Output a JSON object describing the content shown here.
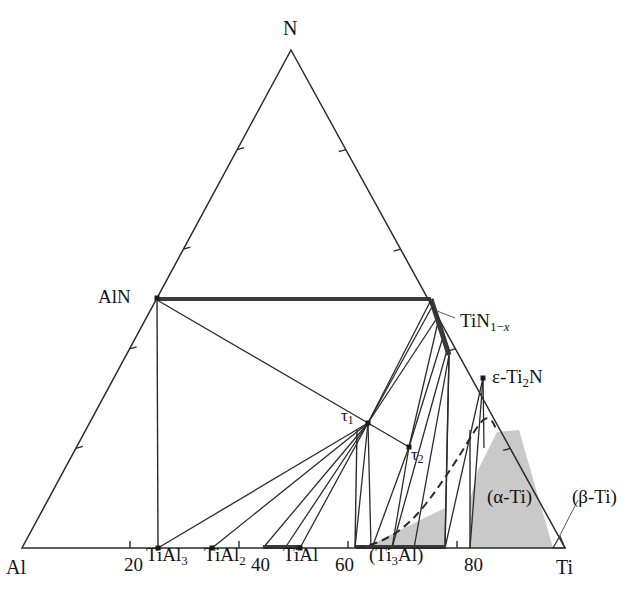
{
  "figure": {
    "kind": "ternary-phase-diagram",
    "system": "Al-Ti-N",
    "background_color": "#ffffff",
    "line_color": "#2b2b2b",
    "shade_color": "#c8c8c8",
    "thick_line_color": "#3a3a3a"
  },
  "corners": {
    "top": {
      "label": "N",
      "x": 291,
      "y": 50
    },
    "bottom_left": {
      "label": "Al",
      "x": 22,
      "y": 548
    },
    "bottom_right": {
      "label": "Ti",
      "x": 565,
      "y": 548
    }
  },
  "corner_labels": [
    {
      "name": "corner-label-n",
      "text": "N",
      "x": 283,
      "y": 18
    },
    {
      "name": "corner-label-al",
      "text": "Al",
      "x": 6,
      "y": 557
    },
    {
      "name": "corner-label-ti",
      "text": "Ti",
      "x": 556,
      "y": 557
    }
  ],
  "axis_ticks": {
    "bottom_values": [
      "20",
      "40",
      "60",
      "80"
    ],
    "bottom_label_positions": [
      {
        "text": "20",
        "x": 124,
        "y": 555
      },
      {
        "text": "40",
        "x": 251,
        "y": 555
      },
      {
        "text": "60",
        "x": 335,
        "y": 555
      },
      {
        "text": "80",
        "x": 464,
        "y": 555
      }
    ],
    "bottom_tick_x": [
      130,
      239,
      348,
      457
    ],
    "left_tick_fractions": [
      0.2,
      0.4,
      0.6,
      0.8
    ],
    "right_tick_fractions": [
      0.2,
      0.4,
      0.6,
      0.8
    ]
  },
  "phase_labels": [
    {
      "name": "phase-label-aln",
      "html": "AlN",
      "x": 98,
      "y": 287,
      "class": "lbl-phase"
    },
    {
      "name": "phase-label-tin1x",
      "html": "TiN<sub>1&#8722;<i>x</i></sub>",
      "x": 460,
      "y": 311,
      "class": "lbl-phase"
    },
    {
      "name": "phase-label-eti2n",
      "html": "&#949;-Ti<sub>2</sub>N",
      "x": 492,
      "y": 367,
      "class": "lbl-phase"
    },
    {
      "name": "phase-label-tial3",
      "html": "TiAl<sub>3</sub>",
      "x": 146,
      "y": 545,
      "class": "lbl-phase"
    },
    {
      "name": "phase-label-tial2",
      "html": "TiAl<sub>2</sub>",
      "x": 204,
      "y": 545,
      "class": "lbl-phase"
    },
    {
      "name": "phase-label-tial",
      "html": "TiAl",
      "x": 283,
      "y": 545,
      "class": "lbl-phase"
    },
    {
      "name": "phase-label-ti3al",
      "html": "(Ti<sub>3</sub>Al)",
      "x": 369,
      "y": 545,
      "class": "lbl-phase"
    },
    {
      "name": "phase-label-alpha-ti",
      "html": "(&#945;-Ti)",
      "x": 487,
      "y": 487,
      "class": "lbl-region"
    },
    {
      "name": "phase-label-beta-ti",
      "html": "(&#946;-Ti)",
      "x": 572,
      "y": 487,
      "class": "lbl-region"
    },
    {
      "name": "phase-label-tau1",
      "html": "&#964;<sub>1</sub>",
      "x": 341,
      "y": 407,
      "class": "lbl-tau"
    },
    {
      "name": "phase-label-tau2",
      "html": "&#964;<sub>2</sub>",
      "x": 411,
      "y": 446,
      "class": "lbl-tau"
    }
  ],
  "nodes": {
    "aln": {
      "x": 157,
      "y": 298,
      "dot": true
    },
    "tin_top": {
      "x": 431,
      "y": 299
    },
    "tin_bot": {
      "x": 449,
      "y": 355
    },
    "eti2n": {
      "x": 483,
      "y": 378,
      "dot": true
    },
    "tau1": {
      "x": 368,
      "y": 423,
      "dot": true
    },
    "tau2": {
      "x": 409,
      "y": 447,
      "dot": true
    },
    "tial3": {
      "x": 158,
      "y": 548,
      "dot": true
    },
    "tial2": {
      "x": 212,
      "y": 548,
      "dot": true
    },
    "tial_a": {
      "x": 263,
      "y": 548
    },
    "tial_b": {
      "x": 300,
      "y": 548,
      "dot": true
    },
    "ti3al_l": {
      "x": 355,
      "y": 548
    },
    "ti3al_r": {
      "x": 445,
      "y": 548
    },
    "beta_l": {
      "x": 470,
      "y": 548
    },
    "ti": {
      "x": 565,
      "y": 548
    }
  },
  "leader_lines": [
    {
      "name": "leader-tin1x",
      "x1": 455,
      "y1": 318,
      "x2": 437,
      "y2": 311
    },
    {
      "name": "leader-beta-ti",
      "x1": 578,
      "y1": 500,
      "x2": 556,
      "y2": 543
    }
  ],
  "tie_lines_from_tau1": [
    {
      "to_x": 157,
      "to_y": 300
    },
    {
      "to_x": 158,
      "to_y": 548
    },
    {
      "to_x": 212,
      "to_y": 548
    },
    {
      "to_x": 263,
      "to_y": 548
    },
    {
      "to_x": 285,
      "to_y": 548
    },
    {
      "to_x": 300,
      "to_y": 548
    },
    {
      "to_x": 355,
      "to_y": 548
    },
    {
      "to_x": 371,
      "to_y": 548
    },
    {
      "to_x": 431,
      "to_y": 300
    },
    {
      "to_x": 437,
      "to_y": 318
    }
  ],
  "tie_lines_from_tin": [
    {
      "from_x": 431,
      "from_y": 299,
      "to_x": 157,
      "to_y": 298
    },
    {
      "from_x": 433,
      "from_y": 305,
      "to_x": 368,
      "to_y": 423
    },
    {
      "from_x": 438,
      "from_y": 322,
      "to_x": 409,
      "to_y": 447
    },
    {
      "from_x": 443,
      "from_y": 337,
      "to_x": 409,
      "to_y": 447
    },
    {
      "from_x": 447,
      "from_y": 350,
      "to_x": 392,
      "to_y": 548
    },
    {
      "from_x": 449,
      "from_y": 355,
      "to_x": 414,
      "to_y": 548
    },
    {
      "from_x": 449,
      "from_y": 355,
      "to_x": 445,
      "to_y": 548
    }
  ],
  "tie_lines_from_eti2n": [
    {
      "to_x": 445,
      "to_y": 548
    },
    {
      "to_x": 470,
      "to_y": 548
    },
    {
      "to_x": 484,
      "to_y": 448
    }
  ],
  "vertical_lines": [
    {
      "name": "vline-aln-tial3",
      "x1": 157,
      "y1": 298,
      "x2": 158,
      "y2": 548
    },
    {
      "name": "vline-ti3al-left",
      "x1": 355,
      "y1": 548,
      "x2": 357,
      "y2": 430
    },
    {
      "name": "vline-ti3al-right",
      "x1": 445,
      "y1": 548,
      "x2": 449,
      "y2": 356
    },
    {
      "name": "vline-beta-left",
      "x1": 470,
      "y1": 548,
      "x2": 470,
      "y2": 430
    }
  ],
  "alpha_ti_region": {
    "name": "alpha-ti-shaded-region",
    "fill": "#c9c9c9",
    "points": "470,548 553,548 519,430 497,432 478,470 470,500"
  },
  "small_shaded_region": {
    "name": "ti3al-small-shaded-region",
    "fill": "#c9c9c9",
    "points": "357,548 445,548 445,508 400,530 375,543"
  },
  "beta_ti_triangle": {
    "name": "beta-ti-triangle",
    "points": "553,548 565,548 560,536"
  },
  "dashed_curve": {
    "name": "alpha-beta-boundary-dashed",
    "path": "M 357,548 C 385,543 405,530 425,505 C 443,482 460,455 474,432 C 483,418 490,410 497,432"
  },
  "thick_segments": [
    {
      "name": "thick-aln-tin-tieline",
      "x1": 158,
      "y1": 299,
      "x2": 431,
      "y2": 299,
      "w": 4
    },
    {
      "name": "thick-tin-edge",
      "x1": 431,
      "y1": 299,
      "x2": 449,
      "y2": 355,
      "w": 5
    },
    {
      "name": "thick-tial-bottom",
      "x1": 263,
      "y1": 547,
      "x2": 301,
      "y2": 547,
      "w": 4
    },
    {
      "name": "thick-ti3al-bottom",
      "x1": 356,
      "y1": 547,
      "x2": 446,
      "y2": 547,
      "w": 4
    }
  ]
}
